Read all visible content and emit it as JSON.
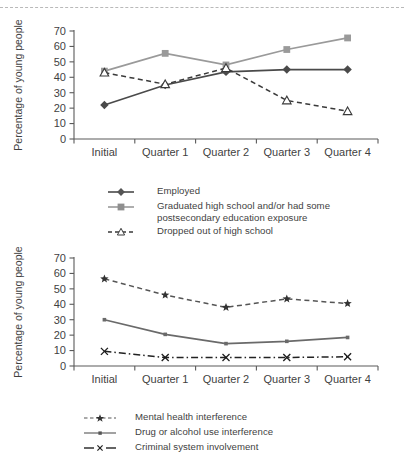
{
  "page": {
    "divider": "dashed-rule"
  },
  "axis": {
    "ylabel": "Percentage of young people",
    "yticks": [
      0,
      10,
      20,
      30,
      40,
      50,
      60,
      70
    ],
    "categories": [
      "Initial",
      "Quarter 1",
      "Quarter 2",
      "Quarter 3",
      "Quarter 4"
    ]
  },
  "chart_data": [
    {
      "id": "outcomes-chart",
      "type": "line",
      "title": "",
      "xlabel": "",
      "ylabel": "Percentage of young people",
      "ylim": [
        0,
        70
      ],
      "ytick_step": 10,
      "grid": false,
      "legend_position": "below",
      "categories": [
        "Initial",
        "Quarter 1",
        "Quarter 2",
        "Quarter 3",
        "Quarter 4"
      ],
      "series": [
        {
          "name": "Employed",
          "values": [
            22,
            35,
            43.5,
            45,
            45
          ],
          "marker": "diamond",
          "linestyle": "solid",
          "color": "#4a4a4a"
        },
        {
          "name": "Graduated high school and/or had some\npostsecondary education exposure",
          "values": [
            44,
            55.5,
            48,
            58,
            65.5
          ],
          "marker": "square",
          "linestyle": "solid",
          "color": "#9a9a9a"
        },
        {
          "name": "Dropped out of high school",
          "values": [
            43,
            35.5,
            46,
            25,
            18
          ],
          "marker": "triangle",
          "linestyle": "dashed",
          "color": "#3a3a3a"
        }
      ]
    },
    {
      "id": "barriers-chart",
      "type": "line",
      "title": "",
      "xlabel": "",
      "ylabel": "Percentage of young people",
      "ylim": [
        0,
        70
      ],
      "ytick_step": 10,
      "grid": false,
      "legend_position": "below",
      "categories": [
        "Initial",
        "Quarter 1",
        "Quarter 2",
        "Quarter 3",
        "Quarter 4"
      ],
      "series": [
        {
          "name": "Mental health interference",
          "values": [
            56.5,
            46,
            38,
            43.5,
            40.5
          ],
          "marker": "star",
          "linestyle": "dashed",
          "color": "#555555"
        },
        {
          "name": "Drug or alcohol use interference",
          "values": [
            30,
            20.5,
            14.5,
            16,
            18.5
          ],
          "marker": "dot",
          "linestyle": "solid",
          "color": "#6a6a6a"
        },
        {
          "name": "Criminal system involvement",
          "values": [
            9.5,
            5.5,
            5.5,
            5.5,
            6
          ],
          "marker": "x",
          "linestyle": "dashdot",
          "color": "#222222"
        }
      ]
    }
  ],
  "legends": {
    "top": [
      {
        "label": "Employed",
        "key": "solid-diamond-key"
      },
      {
        "label": "Graduated high school and/or had some\npostsecondary education exposure",
        "key": "solid-square-key"
      },
      {
        "label": "Dropped out of high school",
        "key": "dashed-triangle-key"
      }
    ],
    "bottom": [
      {
        "label": "Mental health interference",
        "key": "dashed-star-key"
      },
      {
        "label": "Drug or alcohol use interference",
        "key": "solid-dot-key"
      },
      {
        "label": "Criminal system involvement",
        "key": "dashdot-x-key"
      }
    ]
  }
}
